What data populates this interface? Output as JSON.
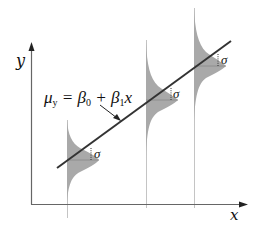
{
  "diagram": {
    "title": "",
    "axes": {
      "x_label": "x",
      "y_label": "y"
    },
    "equation": {
      "lhs": "μ",
      "lhs_sub": "y",
      "eq": " = β",
      "b0_sub": "0",
      "plus": " + β",
      "b1_sub": "1",
      "x": "x"
    },
    "sigma_label": "σ",
    "distributions": [
      {
        "x": 67,
        "mean_y": 160,
        "label": "σ"
      },
      {
        "x": 146,
        "mean_y": 100,
        "label": "σ"
      },
      {
        "x": 194,
        "mean_y": 66,
        "label": "σ"
      }
    ],
    "colors": {
      "axis": "#666666",
      "distribution_fill": "#a8a8a8",
      "regression_line": "#333333",
      "vertical_guides": "#bbbbbb"
    }
  }
}
